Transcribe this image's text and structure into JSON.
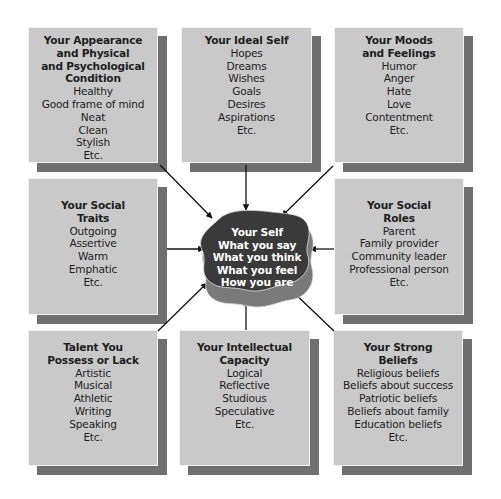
{
  "diagram": {
    "center": {
      "title": "Your Self",
      "items": [
        "What you say",
        "What you think",
        "What you feel",
        "How you are"
      ]
    },
    "boxes": [
      {
        "id": "appearance",
        "title": "Your Appearance\nand Physical\nand Psychological\nCondition",
        "items": [
          "Healthy",
          "Good frame of mind",
          "Neat",
          "Clean",
          "Stylish",
          "Etc."
        ]
      },
      {
        "id": "ideal-self",
        "title": "Your Ideal Self",
        "items": [
          "Hopes",
          "Dreams",
          "Wishes",
          "Goals",
          "Desires",
          "Aspirations",
          "Etc."
        ]
      },
      {
        "id": "moods",
        "title": "Your Moods\nand Feelings",
        "items": [
          "Humor",
          "Anger",
          "Hate",
          "Love",
          "Contentment",
          "Etc."
        ]
      },
      {
        "id": "social-traits",
        "title": "Your Social\nTraits",
        "items": [
          "Outgoing",
          "Assertive",
          "Warm",
          "Emphatic",
          "Etc."
        ]
      },
      {
        "id": "social-roles",
        "title": "Your Social\nRoles",
        "items": [
          "Parent",
          "Family provider",
          "Community leader",
          "Professional person",
          "Etc."
        ]
      },
      {
        "id": "talent",
        "title": "Talent You\nPossess or Lack",
        "items": [
          "Artistic",
          "Musical",
          "Athletic",
          "Writing",
          "Speaking",
          "Etc."
        ]
      },
      {
        "id": "intellectual",
        "title": "Your Intellectual\nCapacity",
        "items": [
          "Logical",
          "Reflective",
          "Studious",
          "Speculative",
          "Etc."
        ]
      },
      {
        "id": "beliefs",
        "title": "Your Strong\nBeliefs",
        "items": [
          "Religious beliefs",
          "Beliefs about success",
          "Patriotic beliefs",
          "Beliefs about family",
          "Education beliefs",
          "Etc."
        ]
      }
    ],
    "colors": {
      "box_fill": "#c9c9c9",
      "box_shadow": "#6f6f6f",
      "center_fill": "#3a3a3a",
      "center_shadow": "#7a7a7a",
      "arrow": "#111111"
    }
  }
}
